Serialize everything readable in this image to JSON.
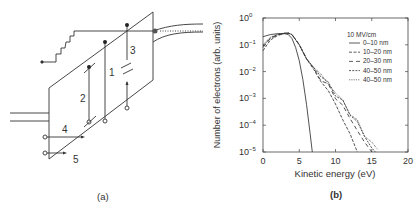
{
  "panel_a": {
    "caption": "(a)",
    "transition_labels": [
      "1",
      "2",
      "3",
      "4",
      "5"
    ]
  },
  "panel_b": {
    "caption": "(b)"
  },
  "chart_data": {
    "type": "line",
    "title": "",
    "xlabel": "Kinetic energy (eV)",
    "ylabel": "Number of electrons (arb. units)",
    "xlim": [
      0,
      20
    ],
    "ylim": [
      1e-05,
      1
    ],
    "yscale": "log",
    "x_ticks": [
      "0",
      "5",
      "10",
      "15",
      "20"
    ],
    "y_ticks": [
      "10^0",
      "10^-1",
      "10^-2",
      "10^-3",
      "10^-4",
      "10^-5"
    ],
    "grid": false,
    "legend_title": "10 MV/cm",
    "legend_position": "upper right",
    "series": [
      {
        "name": "0–10 nm",
        "style": "solid",
        "x": [
          0,
          1,
          2,
          3,
          3.5,
          4,
          4.5,
          5,
          5.5,
          6,
          6.5,
          6.8
        ],
        "y": [
          0.2,
          0.24,
          0.26,
          0.26,
          0.24,
          0.17,
          0.08,
          0.025,
          0.005,
          0.0006,
          5e-05,
          1e-05
        ]
      },
      {
        "name": "10–20 nm",
        "style": "dashed",
        "x": [
          0,
          1,
          2,
          3,
          3.5,
          4,
          5,
          6,
          7,
          8,
          9,
          10,
          11,
          12,
          13
        ],
        "y": [
          0.06,
          0.15,
          0.22,
          0.27,
          0.27,
          0.24,
          0.1,
          0.03,
          0.012,
          0.005,
          0.0018,
          0.0006,
          0.00018,
          4e-05,
          1e-05
        ]
      },
      {
        "name": "20–30 nm",
        "style": "long-dashed",
        "x": [
          0,
          1,
          2,
          3,
          3.5,
          4,
          5,
          6,
          7,
          8,
          9,
          10,
          11,
          12,
          13,
          14,
          15
        ],
        "y": [
          0.08,
          0.17,
          0.23,
          0.27,
          0.27,
          0.24,
          0.1,
          0.03,
          0.013,
          0.006,
          0.0028,
          0.0012,
          0.0005,
          0.00018,
          7e-05,
          2e-05,
          1e-05
        ]
      },
      {
        "name": "40–50 nm",
        "style": "short-dashed",
        "x": [
          0,
          1,
          2,
          3,
          3.5,
          4,
          5,
          6,
          7,
          8,
          9,
          10,
          11,
          12,
          13,
          14,
          15,
          15.5
        ],
        "y": [
          0.09,
          0.18,
          0.24,
          0.27,
          0.27,
          0.24,
          0.1,
          0.03,
          0.014,
          0.007,
          0.0035,
          0.0016,
          0.0007,
          0.0003,
          0.00012,
          4e-05,
          1.5e-05,
          1e-05
        ]
      },
      {
        "name": "40–50 nm",
        "style": "dotted",
        "x": [
          0,
          1,
          2,
          3,
          3.5,
          4,
          5,
          6,
          7,
          8,
          9,
          10,
          11,
          12,
          13,
          14,
          15,
          15.8
        ],
        "y": [
          0.1,
          0.19,
          0.25,
          0.27,
          0.27,
          0.24,
          0.1,
          0.03,
          0.014,
          0.007,
          0.0036,
          0.0017,
          0.00075,
          0.00032,
          0.00013,
          5e-05,
          2e-05,
          1e-05
        ]
      }
    ]
  },
  "axis_text": {
    "xlabel": "Kinetic energy (eV)",
    "ylabel": "Number of electrons (arb. units)",
    "legend_title": "10 MV/cm",
    "legend_items": [
      "0–10 nm",
      "10–20 nm",
      "20–30 nm",
      "40–50 nm",
      "40–50 nm"
    ],
    "x_ticks": [
      "0",
      "5",
      "10",
      "15",
      "20"
    ],
    "y_tick_base": "10",
    "y_tick_exps": [
      "0",
      "−1",
      "−2",
      "−3",
      "−4",
      "−5"
    ]
  }
}
